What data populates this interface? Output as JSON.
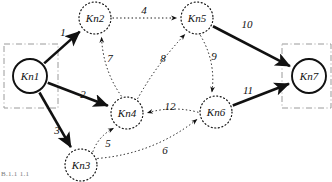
{
  "figure": {
    "type": "directed-weighted-graph",
    "corner_text": "B.1.1 1.1",
    "background": "#ffffff",
    "stroke_color": "#111111",
    "box_color": "#9a9a9a"
  },
  "nodes": [
    {
      "id": "Kn1",
      "label": "Kn1",
      "cx": 30,
      "cy": 76,
      "r": 17,
      "style": "solid",
      "boxed": true
    },
    {
      "id": "Kn2",
      "label": "Kn2",
      "cx": 95,
      "cy": 18,
      "r": 16,
      "style": "dotted",
      "boxed": false
    },
    {
      "id": "Kn3",
      "label": "Kn3",
      "cx": 81,
      "cy": 165,
      "r": 16,
      "style": "dotted",
      "boxed": false
    },
    {
      "id": "Kn4",
      "label": "Kn4",
      "cx": 127,
      "cy": 113,
      "r": 16,
      "style": "dotted",
      "boxed": false
    },
    {
      "id": "Kn5",
      "label": "Kn5",
      "cx": 197,
      "cy": 18,
      "r": 16,
      "style": "dotted",
      "boxed": false
    },
    {
      "id": "Kn6",
      "label": "Kn6",
      "cx": 216,
      "cy": 112,
      "r": 16,
      "style": "dotted",
      "boxed": false
    },
    {
      "id": "Kn7",
      "label": "Kn7",
      "cx": 309,
      "cy": 76,
      "r": 17,
      "style": "solid",
      "boxed": true
    }
  ],
  "boxes": [
    {
      "for": "Kn1",
      "x": 4,
      "y": 44,
      "w": 54,
      "h": 64
    },
    {
      "for": "Kn7",
      "x": 282,
      "y": 44,
      "w": 49,
      "h": 64
    }
  ],
  "edges": [
    {
      "id": "e1",
      "from": "Kn1",
      "to": "Kn2",
      "weight": "1",
      "style": "solid",
      "label_x": 63,
      "label_y": 36
    },
    {
      "id": "e2",
      "from": "Kn1",
      "to": "Kn4",
      "weight": "2",
      "style": "solid",
      "label_x": 83,
      "label_y": 98
    },
    {
      "id": "e3",
      "from": "Kn1",
      "to": "Kn3",
      "weight": "3",
      "style": "solid",
      "label_x": 57,
      "label_y": 134
    },
    {
      "id": "e4",
      "from": "Kn2",
      "to": "Kn5",
      "weight": "4",
      "style": "dotted",
      "label_x": 144,
      "label_y": 14
    },
    {
      "id": "e5",
      "from": "Kn3",
      "to": "Kn4",
      "weight": "5",
      "style": "dotted",
      "label_x": 108,
      "label_y": 147
    },
    {
      "id": "e6",
      "from": "Kn3",
      "to": "Kn6",
      "weight": "6",
      "style": "dotted",
      "label_x": 165,
      "label_y": 154
    },
    {
      "id": "e7",
      "from": "Kn4",
      "to": "Kn2",
      "weight": "7",
      "style": "dotted",
      "label_x": 110,
      "label_y": 62
    },
    {
      "id": "e8",
      "from": "Kn4",
      "to": "Kn5",
      "weight": "8",
      "style": "dotted",
      "label_x": 163,
      "label_y": 62
    },
    {
      "id": "e9",
      "from": "Kn5",
      "to": "Kn6",
      "weight": "9",
      "style": "dotted",
      "label_x": 214,
      "label_y": 60
    },
    {
      "id": "e10",
      "from": "Kn5",
      "to": "Kn7",
      "weight": "10",
      "style": "solid",
      "label_x": 247,
      "label_y": 28
    },
    {
      "id": "e11",
      "from": "Kn6",
      "to": "Kn7",
      "weight": "11",
      "style": "solid",
      "label_x": 248,
      "label_y": 94
    },
    {
      "id": "e12",
      "from": "Kn6",
      "to": "Kn4",
      "weight": "12",
      "style": "dotted",
      "label_x": 170,
      "label_y": 110
    }
  ]
}
